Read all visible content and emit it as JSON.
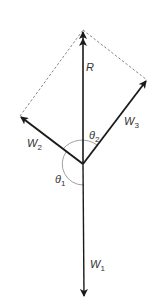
{
  "diagram": {
    "type": "vector-force-diagram",
    "colors": {
      "vector": "#1a1a1a",
      "dashed": "#777777",
      "arc": "#888888",
      "text": "#333333",
      "background": "#ffffff"
    },
    "vectors": [
      {
        "id": "R",
        "label": "R",
        "subscript": "",
        "from": [
          83,
          164
        ],
        "to": [
          83,
          30
        ]
      },
      {
        "id": "W1",
        "label": "W",
        "subscript": "1",
        "from": [
          83,
          164
        ],
        "to": [
          84,
          297
        ]
      },
      {
        "id": "W2",
        "label": "W",
        "subscript": "2",
        "from": [
          83,
          164
        ],
        "to": [
          20,
          116
        ]
      },
      {
        "id": "W3",
        "label": "W",
        "subscript": "3",
        "from": [
          83,
          164
        ],
        "to": [
          147,
          80
        ]
      }
    ],
    "dashed_lines": [
      {
        "from": [
          20,
          116
        ],
        "to": [
          83,
          30
        ]
      },
      {
        "from": [
          83,
          30
        ],
        "to": [
          147,
          80
        ]
      }
    ],
    "angles": [
      {
        "label": "θ",
        "subscript": "2",
        "between": [
          "R",
          "W3"
        ]
      },
      {
        "label": "θ",
        "subscript": "1",
        "between": [
          "W2",
          "W1"
        ]
      }
    ],
    "labels": {
      "R": "R",
      "W1_main": "W",
      "W1_sub": "1",
      "W2_main": "W",
      "W2_sub": "2",
      "W3_main": "W",
      "W3_sub": "3",
      "theta1_main": "θ",
      "theta1_sub": "1",
      "theta2_main": "θ",
      "theta2_sub": "2"
    }
  }
}
